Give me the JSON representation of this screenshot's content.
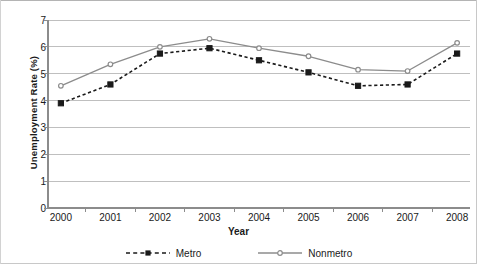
{
  "chart_data": {
    "type": "line",
    "title": "",
    "xlabel": "Year",
    "ylabel": "Unemployment Rate (%)",
    "categories": [
      "2000",
      "2001",
      "2002",
      "2003",
      "2004",
      "2005",
      "2006",
      "2007",
      "2008"
    ],
    "x": [
      2000,
      2001,
      2002,
      2003,
      2004,
      2005,
      2006,
      2007,
      2008
    ],
    "xlim": [
      2000,
      2008
    ],
    "ylim": [
      0,
      7
    ],
    "yticks": [
      0,
      1,
      2,
      3,
      4,
      5,
      6,
      7
    ],
    "ytick_labels": [
      "0",
      "1",
      "2",
      "3",
      "4",
      "5",
      "6",
      "7"
    ],
    "grid": "horizontal",
    "legend_position": "bottom",
    "series": [
      {
        "name": "Metro",
        "color": "#1a1a1a",
        "line_style": "dashed",
        "marker": "square",
        "values": [
          3.9,
          4.6,
          5.75,
          5.95,
          5.5,
          5.05,
          4.55,
          4.6,
          5.75
        ]
      },
      {
        "name": "Nonmetro",
        "color": "#8c8c8c",
        "line_style": "solid",
        "marker": "circle",
        "values": [
          4.55,
          5.35,
          6.0,
          6.3,
          5.95,
          5.65,
          5.15,
          5.1,
          6.15
        ]
      }
    ]
  },
  "axes": {
    "y_title": "Unemployment Rate (%)",
    "x_title": "Year"
  },
  "legend": {
    "items": [
      {
        "label": "Metro"
      },
      {
        "label": "Nonmetro"
      }
    ]
  },
  "colors": {
    "metro": "#1a1a1a",
    "nonmetro": "#8c8c8c",
    "grid": "#bfbfbf",
    "axis": "#8c8c8c",
    "text": "#1a1a1a"
  }
}
